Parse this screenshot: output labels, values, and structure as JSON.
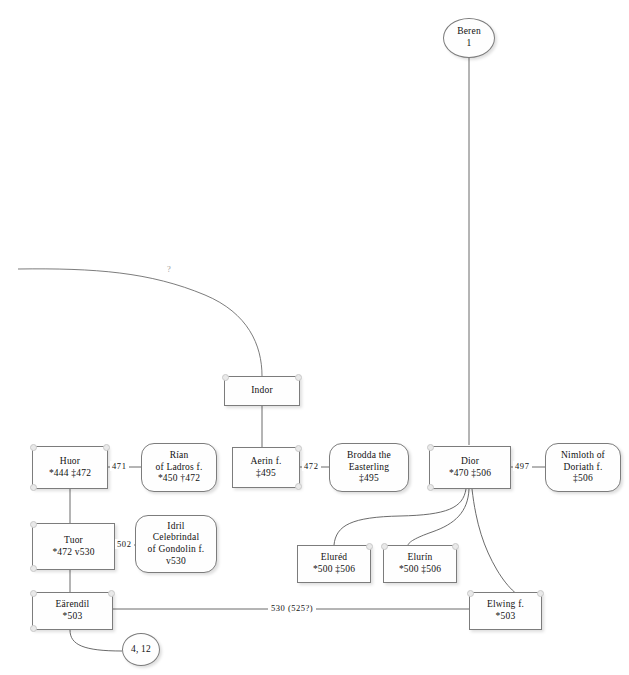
{
  "diagram": {
    "kind": "family-tree"
  },
  "nodes": {
    "beren": {
      "name": "Beren",
      "detail": "1",
      "shape": "circle"
    },
    "indor": {
      "name": "Indor",
      "detail": "",
      "shape": "rect"
    },
    "huor": {
      "name": "Huor",
      "detail": "*444  ‡472",
      "shape": "rect"
    },
    "rian": {
      "name": "Rían",
      "name2": "of Ladros f.",
      "detail": "*450 †472",
      "shape": "rounded"
    },
    "aerin": {
      "name": "Aerin f.",
      "detail": "‡495",
      "shape": "rect"
    },
    "brodda": {
      "name": "Brodda the",
      "name2": "Easterling",
      "detail": "‡495",
      "shape": "rounded"
    },
    "dior": {
      "name": "Dior",
      "detail": "*470  ‡506",
      "shape": "rect"
    },
    "nimloth": {
      "name": "Nimloth of",
      "name2": "Doriath f.",
      "detail": "‡506",
      "shape": "rounded"
    },
    "tuor": {
      "name": "Tuor",
      "detail": "*472 v530",
      "shape": "rect"
    },
    "idril": {
      "name": "Idril",
      "name2": "Celebrindal",
      "name3": "of Gondolin f.",
      "detail": "v530",
      "shape": "rounded"
    },
    "elured": {
      "name": "Eluréd",
      "detail": "*500  ‡506",
      "shape": "rect"
    },
    "elurin": {
      "name": "Elurín",
      "detail": "*500  ‡506",
      "shape": "rect"
    },
    "earendil": {
      "name": "Eärendil",
      "detail": "*503",
      "shape": "rect"
    },
    "elwing": {
      "name": "Elwing f.",
      "detail": "*503",
      "shape": "rect"
    },
    "ref412": {
      "name": "4, 12",
      "detail": "",
      "shape": "circle"
    }
  },
  "edge_labels": {
    "huor_rian": "471",
    "aerin_brodda": "472",
    "dior_nimloth": "497",
    "tuor_idril": "502",
    "earendil_elwing": "530 (525?)",
    "unknown": "?"
  },
  "colors": {
    "node_fill": "#fefefe",
    "node_border": "#7c7c7c",
    "line": "#5a5a5a",
    "anchor_dot": "#e9e9e9",
    "background": "#ffffff"
  }
}
